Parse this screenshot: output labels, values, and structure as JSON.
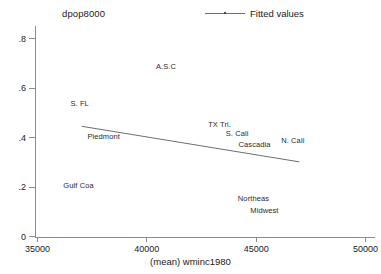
{
  "chart_data": {
    "type": "scatter",
    "title": "",
    "ylabel": "dpop8000",
    "xlabel": "(mean) wminc1980",
    "xlim": [
      35000,
      50000
    ],
    "ylim": [
      0,
      0.85
    ],
    "grid": false,
    "xticks": [
      35000,
      40000,
      45000,
      50000
    ],
    "xtick_labels": [
      "35000",
      "40000",
      "45000",
      "50000"
    ],
    "yticks": [
      0,
      0.2,
      0.4,
      0.6,
      0.8
    ],
    "ytick_labels": [
      "0",
      ".2",
      ".4",
      ".6",
      ".8"
    ],
    "legend": {
      "position": "top-right",
      "entries": [
        {
          "label": "Fitted values",
          "marker": "line"
        }
      ]
    },
    "points": [
      {
        "label": "A.S.C",
        "x": 40900,
        "y": 0.69
      },
      {
        "label": "S. FL",
        "x": 36950,
        "y": 0.537
      },
      {
        "label": "TX Tri.",
        "x": 43350,
        "y": 0.453
      },
      {
        "label": "S. Cali",
        "x": 44150,
        "y": 0.418
      },
      {
        "label": "N. Cali",
        "x": 46700,
        "y": 0.388
      },
      {
        "label": "Cascadia",
        "x": 44950,
        "y": 0.373
      },
      {
        "label": "Piedmont",
        "x": 38050,
        "y": 0.405
      },
      {
        "label": "Gulf Coa",
        "x": 36900,
        "y": 0.208
      },
      {
        "label": "Northeas",
        "x": 44900,
        "y": 0.155
      },
      {
        "label": "Midwest",
        "x": 45400,
        "y": 0.105
      }
    ],
    "series": [
      {
        "name": "Fitted values",
        "type": "line",
        "x": [
          37050,
          47000
        ],
        "y": [
          0.444,
          0.3
        ]
      }
    ]
  },
  "colors": {
    "background": "#ffffff",
    "axis": "#8c8c8c",
    "text": "#1a1a1a",
    "fit_line": "#6e6e6e",
    "point_label": "#2a2a2a"
  }
}
